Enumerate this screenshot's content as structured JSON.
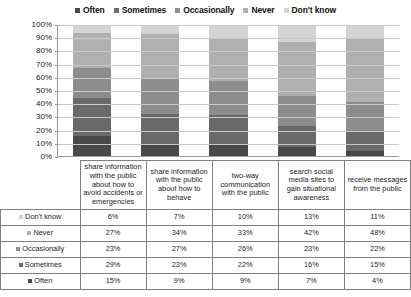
{
  "chart_data": {
    "type": "bar",
    "subtype": "100% stacked bar with data table",
    "title": "",
    "subtitle": "",
    "xlabel": "",
    "ylabel": "",
    "ylim": [
      0,
      100
    ],
    "grid": true,
    "legend_position": "top",
    "categories": [
      "share information with the public about how to avoid accidents or emergencies",
      "share information with the public about how to behave",
      "two-way communication with the public",
      "search social media sites to gain situational awareness",
      "receive messages from the public"
    ],
    "series": [
      {
        "name": "Don't know",
        "color": "#d4d4d4",
        "values": [
          6,
          7,
          10,
          13,
          11
        ],
        "labels": [
          "6%",
          "7%",
          "10%",
          "13%",
          "11%"
        ]
      },
      {
        "name": "Never",
        "color": "#b0b0b0",
        "values": [
          27,
          34,
          33,
          42,
          48
        ],
        "labels": [
          "27%",
          "34%",
          "33%",
          "42%",
          "48%"
        ]
      },
      {
        "name": "Occasionally",
        "color": "#8d8d8d",
        "values": [
          23,
          27,
          26,
          23,
          22
        ],
        "labels": [
          "23%",
          "27%",
          "26%",
          "23%",
          "22%"
        ]
      },
      {
        "name": "Sometimes",
        "color": "#6a6a6a",
        "values": [
          29,
          23,
          22,
          16,
          15
        ],
        "labels": [
          "29%",
          "23%",
          "22%",
          "16%",
          "15%"
        ]
      },
      {
        "name": "Often",
        "color": "#484848",
        "values": [
          15,
          9,
          9,
          7,
          4
        ],
        "labels": [
          "15%",
          "9%",
          "9%",
          "7%",
          "4%"
        ]
      }
    ],
    "stack_order_top_to_bottom": [
      "Don't know",
      "Never",
      "Occasionally",
      "Sometimes",
      "Often"
    ],
    "ytick_labels": [
      "100%",
      "90%",
      "80%",
      "70%",
      "60%",
      "50%",
      "40%",
      "30%",
      "20%",
      "10%",
      "0%"
    ],
    "ytick_values": [
      100,
      90,
      80,
      70,
      60,
      50,
      40,
      30,
      20,
      10,
      0
    ]
  },
  "legend": {
    "items": [
      {
        "label": "Often",
        "color": "#484848"
      },
      {
        "label": "Sometimes",
        "color": "#6a6a6a"
      },
      {
        "label": "Occasionally",
        "color": "#8d8d8d"
      },
      {
        "label": "Never",
        "color": "#b0b0b0"
      },
      {
        "label": "Don't know",
        "color": "#d4d4d4"
      }
    ]
  },
  "table": {
    "column_headers": [
      "share information with the public about how to avoid accidents or emergencies",
      "share information with the public about how to behave",
      "two-way communication with the public",
      "search social media sites to gain situational awareness",
      "receive messages from the public"
    ],
    "rows": [
      {
        "label": "Don't know",
        "color": "#d4d4d4",
        "values": [
          "6%",
          "7%",
          "10%",
          "13%",
          "11%"
        ]
      },
      {
        "label": "Never",
        "color": "#b0b0b0",
        "values": [
          "27%",
          "34%",
          "33%",
          "42%",
          "48%"
        ]
      },
      {
        "label": "Occasionally",
        "color": "#8d8d8d",
        "values": [
          "23%",
          "27%",
          "26%",
          "23%",
          "22%"
        ]
      },
      {
        "label": "Sometimes",
        "color": "#6a6a6a",
        "values": [
          "29%",
          "23%",
          "22%",
          "16%",
          "15%"
        ]
      },
      {
        "label": "Often",
        "color": "#484848",
        "values": [
          "15%",
          "9%",
          "9%",
          "7%",
          "4%"
        ]
      }
    ]
  },
  "colors": {
    "axis": "#9a9a9a",
    "grid": "#c9c9c9",
    "table_border": "#808080",
    "background": "#ffffff",
    "text": "#1a1a1a"
  }
}
